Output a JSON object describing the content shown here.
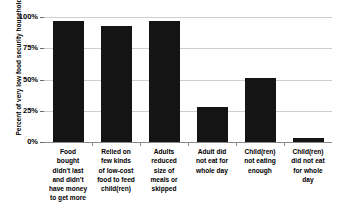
{
  "chart_data": {
    "type": "bar",
    "title": "",
    "subtitle": "",
    "xlabel": "",
    "ylabel": "Percent of very low food security households",
    "categories": [
      "Food bought didn't last and didn't have money to get more",
      "Relied on few kinds of low-cost food to feed child(ren)",
      "Adults reduced size of meals or skipped",
      "Adult did not eat for whole day",
      "Child(ren) not eating enough",
      "Child(ren) did not eat for whole day"
    ],
    "category_lines": [
      [
        "Food",
        "bought",
        "didn't last",
        "and didn't",
        "have money",
        "to get more"
      ],
      [
        "Relied on",
        "few kinds",
        "of low-cost",
        "food to feed",
        "child(ren)"
      ],
      [
        "Adults",
        "reduced",
        "size of",
        "meals or",
        "skipped"
      ],
      [
        "Adult did",
        "not eat for",
        "whole day"
      ],
      [
        "Child(ren)",
        "not eating",
        "enough"
      ],
      [
        "Child(ren)",
        "did not eat",
        "for whole",
        "day"
      ]
    ],
    "values": [
      97,
      93,
      97,
      28,
      51,
      3
    ],
    "value_labels": [
      "97%",
      "93%",
      "97%",
      "28%",
      "51%",
      "3%"
    ],
    "ylim": [
      0,
      100
    ],
    "ytick_values": [
      0,
      25,
      50,
      75,
      100
    ],
    "ytick_labels": [
      "0%",
      "25%",
      "50%",
      "75%",
      "100%"
    ],
    "grid": true,
    "legend": false,
    "legend_position": "none",
    "bar_color": "#141414",
    "gridline_color": "#cfcfcf",
    "axis_color": "#8a8a8a",
    "background_color": "#ffffff"
  }
}
